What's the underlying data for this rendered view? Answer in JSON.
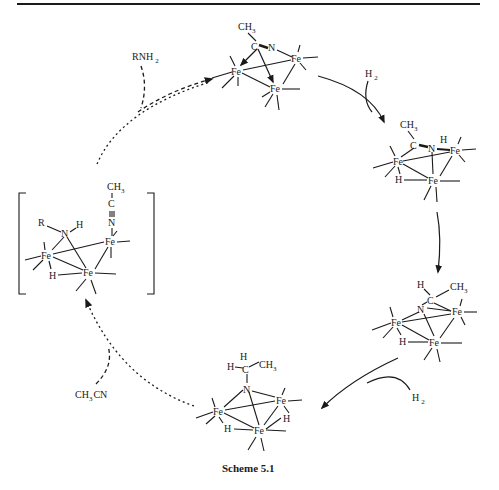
{
  "header": {
    "rule": true
  },
  "caption": "Scheme 5.1",
  "reagents": {
    "amine": {
      "main": "RNH",
      "sub": "2"
    },
    "h2_top": {
      "main": "H",
      "sub": "2"
    },
    "h2_bottom": {
      "main": "H",
      "sub": "2"
    },
    "acetonitrile": {
      "main": "CH",
      "sub": "3",
      "tail": "CN"
    }
  },
  "atoms": {
    "fe": "Fe",
    "n": "N",
    "c": "C",
    "h": "H",
    "r": "R",
    "ch3_main": "CH",
    "ch3_sub": "3",
    "triple": "≡"
  },
  "structures": [
    {
      "id": "top",
      "description": "Fe3 cluster with mu3-eta2 CH3C=N ligand"
    },
    {
      "id": "right-upper",
      "description": "Fe3 cluster with CH3C=NH ligand and Fe-H hydride"
    },
    {
      "id": "right-lower",
      "description": "Fe3 cluster with CH3CH-N ligand and Fe-H hydride"
    },
    {
      "id": "bottom",
      "description": "Fe3 cluster with mu3-NCH2CH3 nitrene and two hydrides"
    },
    {
      "id": "left-intermediate",
      "description": "Bracketed intermediate with RNH, CH3C≡N ligand, Fe-H"
    }
  ]
}
